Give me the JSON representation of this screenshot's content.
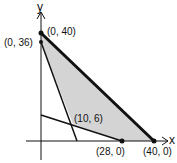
{
  "diagram": {
    "type": "linear-programming-feasible-region",
    "axes": {
      "x_label": "x",
      "y_label": "y"
    },
    "points": [
      {
        "label": "(0, 40)",
        "x": 0,
        "y": 40
      },
      {
        "label": "(0, 36)",
        "x": 0,
        "y": 36
      },
      {
        "label": "(10, 6)",
        "x": 10,
        "y": 6
      },
      {
        "label": "(28, 0)",
        "x": 28,
        "y": 0
      },
      {
        "label": "(40, 0)",
        "x": 40,
        "y": 0
      }
    ],
    "lines": [
      {
        "from": "(0, 40)",
        "to": "(40, 0)",
        "style": "thick"
      },
      {
        "from": "(0, 36)",
        "to": "(12, 0)",
        "style": "thin"
      },
      {
        "from": "(0, 9)",
        "to": "(28, 0)",
        "style": "thin"
      }
    ],
    "shaded_region": [
      "(0, 40)",
      "(0, 36)",
      "(10, 6)",
      "(28, 0)",
      "(40, 0)"
    ],
    "colors": {
      "shade": "#d4d4d4",
      "line": "#111111"
    }
  }
}
